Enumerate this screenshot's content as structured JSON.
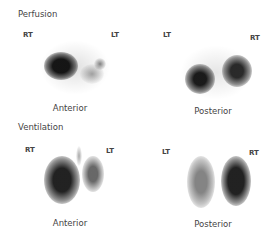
{
  "sections": [
    {
      "label": "Perfusion",
      "views": [
        {
          "caption": "Anterior",
          "left": "RT",
          "right": "LT"
        },
        {
          "caption": "Posterior",
          "left": "LT",
          "right": "RT"
        }
      ]
    },
    {
      "label": "Ventilation",
      "views": [
        {
          "caption": "Anterior",
          "left": "RT",
          "right": "LT"
        },
        {
          "caption": "Posterior",
          "left": "LT",
          "right": "RT"
        }
      ]
    }
  ]
}
